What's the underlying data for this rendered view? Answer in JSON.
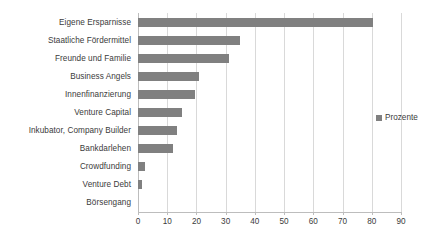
{
  "chart_data": {
    "type": "bar",
    "orientation": "horizontal",
    "title": "",
    "subtitle": "",
    "xlabel": "",
    "ylabel": "",
    "xlim": [
      0,
      90
    ],
    "xticks": [
      "0",
      "10",
      "20",
      "30",
      "40",
      "50",
      "60",
      "70",
      "80",
      "90"
    ],
    "xtick_values": [
      0,
      10,
      20,
      30,
      40,
      50,
      60,
      70,
      80,
      90
    ],
    "grid": "vertical",
    "legend_position": "right",
    "categories": [
      "Börsengang",
      "Venture Debt",
      "Crowdfunding",
      "Bankdarlehen",
      "Inkubator, Company Builder",
      "Venture Capital",
      "Innenfinanzierung",
      "Business Angels",
      "Freunde und Familie",
      "Staatliche Fördermittel",
      "Eigene Ersparnisse"
    ],
    "series": [
      {
        "name": "Prozente",
        "color": "#808080",
        "values": [
          0,
          1.5,
          2.5,
          12,
          13.5,
          15,
          19.5,
          21,
          31,
          35,
          80.5
        ]
      }
    ]
  },
  "legend": {
    "entries": [
      {
        "label": "Prozente",
        "color": "#808080"
      }
    ]
  },
  "colors": {
    "bar": "#808080",
    "gridline": "#d9d9d9",
    "axis": "#bdbdbd",
    "text": "#3b3b3b",
    "background": "#ffffff"
  }
}
